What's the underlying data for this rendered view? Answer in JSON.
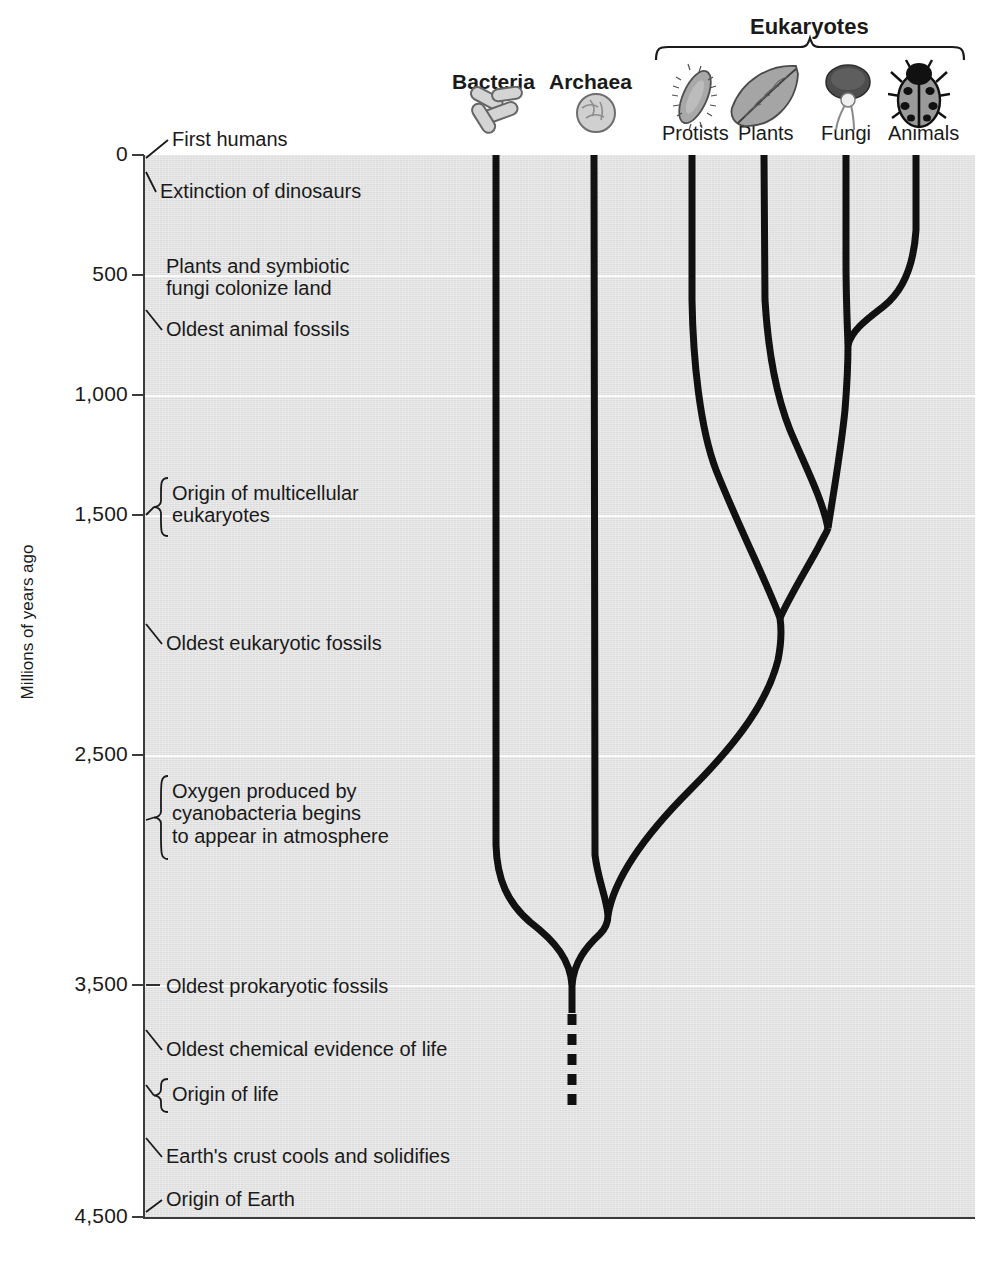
{
  "figure": {
    "axis_title": "Millions of years ago",
    "y_axis": {
      "unit": "millions of years ago",
      "top_value": 0,
      "bottom_value": 4500,
      "direction": "top is present (0), bottom is oldest (4,500)",
      "ticks": [
        {
          "label": "0",
          "value": 0,
          "y": 155
        },
        {
          "label": "500",
          "value": 500,
          "y": 275
        },
        {
          "label": "1,000",
          "value": 1000,
          "y": 395
        },
        {
          "label": "1,500",
          "value": 1500,
          "y": 515
        },
        {
          "label": "2,500",
          "value": 2500,
          "y": 755
        },
        {
          "label": "3,500",
          "value": 3500,
          "y": 985
        },
        {
          "label": "4,500",
          "value": 4500,
          "y": 1217
        }
      ]
    },
    "events": [
      {
        "text": "First humans",
        "value_mya": 0,
        "connector": "leader",
        "label_x": 172,
        "label_y": 128,
        "anchor_y": 158
      },
      {
        "text": "Extinction of dinosaurs",
        "value_mya": 65,
        "connector": "leader",
        "label_x": 160,
        "label_y": 180,
        "anchor_y": 172
      },
      {
        "text": "Plants and symbiotic\nfungi colonize land",
        "value_mya": 500,
        "connector": "none",
        "label_x": 166,
        "label_y": 255,
        "anchor_y": 275
      },
      {
        "text": "Oldest animal fossils",
        "value_mya": 700,
        "connector": "leader",
        "label_x": 166,
        "label_y": 318,
        "anchor_y": 310
      },
      {
        "text": "Origin of multicellular\neukaryotes",
        "value_mya": 1500,
        "connector": "brace",
        "label_x": 172,
        "label_y": 482,
        "anchor_y": 515
      },
      {
        "text": "Oldest eukaryotic fossils",
        "value_mya": 2100,
        "connector": "leader",
        "label_x": 166,
        "label_y": 632,
        "anchor_y": 624
      },
      {
        "text": "Oxygen produced by\ncyanobacteria begins\nto appear in atmosphere",
        "value_mya": 2700,
        "connector": "brace",
        "label_x": 172,
        "label_y": 780,
        "anchor_y": 820
      },
      {
        "text": "Oldest prokaryotic fossils",
        "value_mya": 3500,
        "connector": "line",
        "label_x": 166,
        "label_y": 975,
        "anchor_y": 985
      },
      {
        "text": "Oldest chemical evidence of life",
        "value_mya": 3850,
        "connector": "leader",
        "label_x": 166,
        "label_y": 1038,
        "anchor_y": 1030
      },
      {
        "text": "Origin of life",
        "value_mya": 3950,
        "connector": "brace",
        "label_x": 172,
        "label_y": 1083,
        "anchor_y": 1085
      },
      {
        "text": "Earth's crust cools and solidifies",
        "value_mya": 4200,
        "connector": "leader",
        "label_x": 166,
        "label_y": 1145,
        "anchor_y": 1138
      },
      {
        "text": "Origin of Earth",
        "value_mya": 4500,
        "connector": "leader",
        "label_x": 166,
        "label_y": 1188,
        "anchor_y": 1212
      }
    ],
    "domains": [
      {
        "label": "Bacteria",
        "icon": "bacteria-rods-icon",
        "label_x": 452,
        "label_y": 70,
        "stem_x": 496
      },
      {
        "label": "Archaea",
        "icon": "archaea-cell-icon",
        "label_x": 549,
        "label_y": 70,
        "stem_x": 594
      }
    ],
    "eukaryotes": {
      "title": "Eukaryotes",
      "bracket": {
        "left_x": 655,
        "right_x": 965,
        "y": 48
      },
      "title_x": 750,
      "title_y": 14,
      "groups": [
        {
          "label": "Protists",
          "icon": "paramecium-icon",
          "label_x": 662,
          "label_y": 122,
          "tip_x": 692
        },
        {
          "label": "Plants",
          "icon": "leaf-icon",
          "label_x": 738,
          "label_y": 122,
          "tip_x": 764
        },
        {
          "label": "Fungi",
          "icon": "mushroom-icon",
          "label_x": 821,
          "label_y": 122,
          "tip_x": 846
        },
        {
          "label": "Animals",
          "icon": "ladybug-icon",
          "label_x": 888,
          "label_y": 122,
          "tip_x": 916
        }
      ]
    },
    "tree_nodes": [
      {
        "name": "root-origin-of-life",
        "x": 572,
        "y_mya": 4050,
        "note": "dashed uncertain root below 3,500"
      },
      {
        "name": "bacteria-archaea-eukaryote-split",
        "x": 572,
        "y_mya": 3500
      },
      {
        "name": "archaea-eukaryote-split",
        "x": 604,
        "y_mya": 3280
      },
      {
        "name": "protist-split",
        "x": 780,
        "y_mya": 2000
      },
      {
        "name": "plant-split",
        "x": 828,
        "y_mya": 1580
      },
      {
        "name": "fungi-animal-split",
        "x": 848,
        "y_mya": 760
      }
    ]
  },
  "colors": {
    "plot_background": "#e3e3e3",
    "gridline": "#fbfbfb",
    "branch": "#111111",
    "text": "#1a1a1a",
    "axis": "#3c3c3c"
  }
}
